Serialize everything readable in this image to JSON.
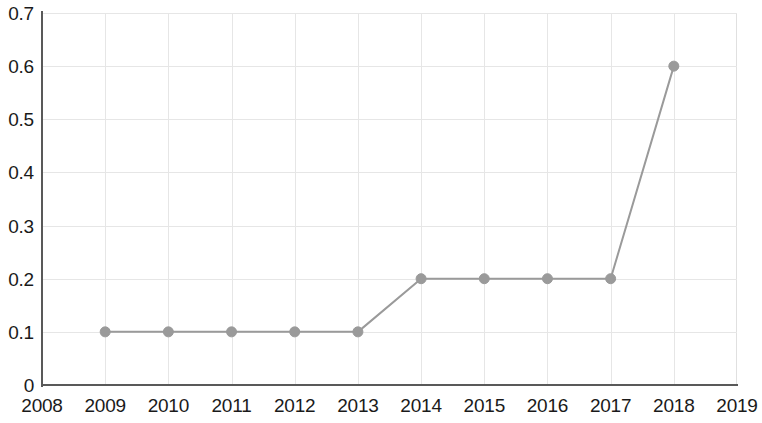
{
  "chart_data": {
    "type": "line",
    "title": "",
    "subtitle": "",
    "xlabel": "",
    "ylabel": "",
    "x": [
      2008,
      2009,
      2010,
      2011,
      2012,
      2013,
      2014,
      2015,
      2016,
      2017,
      2018,
      2019
    ],
    "categories": [
      "2008",
      "2009",
      "2010",
      "2011",
      "2012",
      "2013",
      "2014",
      "2015",
      "2016",
      "2017",
      "2018",
      "2019"
    ],
    "series": [
      {
        "name": "",
        "x": [
          2009,
          2010,
          2011,
          2012,
          2013,
          2014,
          2015,
          2016,
          2017,
          2018
        ],
        "values": [
          0.1,
          0.1,
          0.1,
          0.1,
          0.1,
          0.2,
          0.2,
          0.2,
          0.2,
          0.6
        ],
        "color": "#9a9a9a",
        "marker": "circle"
      }
    ],
    "xlim": [
      2008,
      2019
    ],
    "ylim": [
      0,
      0.7
    ],
    "x_tick_labels": [
      "2008",
      "2009",
      "2010",
      "2011",
      "2012",
      "2013",
      "2014",
      "2015",
      "2016",
      "2017",
      "2018",
      "2019"
    ],
    "y_tick_values": [
      0.7,
      0.6,
      0.5,
      0.4,
      0.3,
      0.2,
      0.1,
      0
    ],
    "y_tick_labels": [
      "0.7",
      "0.6",
      "0.5",
      "0.4",
      "0.3",
      "0.2",
      "0.1",
      "0"
    ],
    "grid": true,
    "grid_color": "#e6e6e6",
    "axis_color": "#595959",
    "legend": false,
    "legend_position": "none",
    "annotations": []
  }
}
